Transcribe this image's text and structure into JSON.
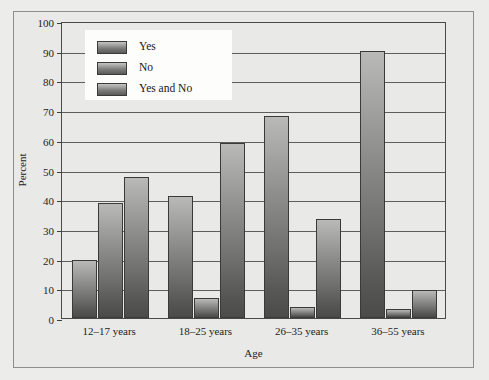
{
  "chart_data": {
    "type": "bar",
    "title": "",
    "xlabel": "Age",
    "ylabel": "Percent",
    "ylim": [
      0,
      100
    ],
    "ytick_step": 10,
    "yticks": [
      0,
      10,
      20,
      30,
      40,
      50,
      60,
      70,
      80,
      90,
      100
    ],
    "grid": true,
    "legend_position": "upper-left-inside",
    "categories": [
      "12–17 years",
      "18–25 years",
      "26–35 years",
      "36–55 years"
    ],
    "series": [
      {
        "name": "Yes",
        "values": [
          19.5,
          41.0,
          68.0,
          90.0
        ]
      },
      {
        "name": "No",
        "values": [
          38.7,
          6.7,
          3.8,
          3.0
        ]
      },
      {
        "name": "Yes and No",
        "values": [
          47.5,
          59.0,
          33.5,
          9.3
        ]
      }
    ],
    "colors": {
      "bar_gradient_top": "#c0c0be",
      "bar_gradient_bottom": "#4b4b49",
      "bar_outline": "#3a3a38",
      "plot_background": "#e9e9e7",
      "figure_background": "#ececeb",
      "gridline": "#5d5d5b",
      "axis": "#3e3e3c",
      "legend_background": "#fdfdfc",
      "text": "#1e1e1c"
    }
  }
}
